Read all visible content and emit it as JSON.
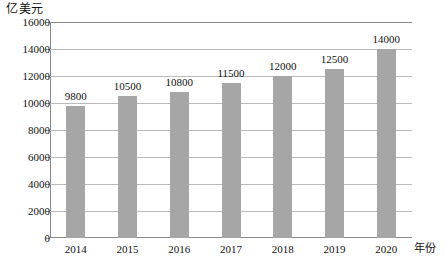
{
  "chart_data": {
    "type": "bar",
    "title": "",
    "subtitle": "",
    "categories": [
      "2014",
      "2015",
      "2016",
      "2017",
      "2018",
      "2019",
      "2020"
    ],
    "values": [
      9800,
      10500,
      10800,
      11500,
      12000,
      12500,
      14000
    ],
    "data_labels": [
      "9800",
      "10500",
      "10800",
      "11500",
      "12000",
      "12500",
      "14000"
    ],
    "xlabel": "年份",
    "ylabel": "亿美元",
    "ylim": [
      0,
      16000
    ],
    "ytick_values": [
      0,
      2000,
      4000,
      6000,
      8000,
      10000,
      12000,
      14000,
      16000
    ],
    "ytick_labels": [
      "0",
      "2000",
      "4000",
      "6000",
      "8000",
      "10000",
      "12000",
      "14000",
      "16000"
    ],
    "grid": true,
    "grid_axis": "y",
    "legend": false,
    "legend_position": "none",
    "bar_color": "#a6a6a6",
    "grid_color": "#b9b9b9",
    "axis_color": "#8a8a8a",
    "background_color": "#ffffff"
  }
}
